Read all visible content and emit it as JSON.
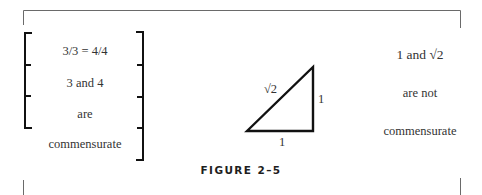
{
  "figure": {
    "caption": "FIGURE 2–5",
    "left_column": {
      "rows": [
        "3/3 = 4/4",
        "3 and 4",
        "are",
        "commensurate"
      ]
    },
    "triangle": {
      "hypotenuse_label": "√2",
      "vertical_side_label": "1",
      "base_label": "1"
    },
    "right_column": {
      "lines": [
        "1 and √2",
        "are not",
        "commensurate"
      ]
    }
  }
}
